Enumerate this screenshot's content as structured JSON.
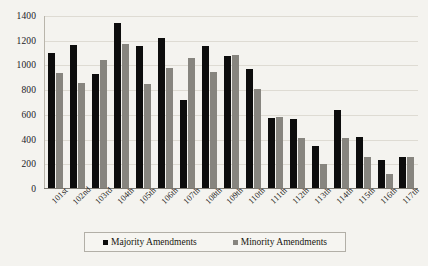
{
  "chart_data": {
    "type": "bar",
    "title": "",
    "xlabel": "",
    "ylabel": "",
    "ylim": [
      0,
      1400
    ],
    "yticks": [
      0,
      200,
      400,
      600,
      800,
      1000,
      1200,
      1400
    ],
    "ytick_labels": [
      "0",
      "200",
      "400",
      "600",
      "800",
      "1000",
      "1200",
      "1400"
    ],
    "grid": true,
    "legend_position": "bottom",
    "categories": [
      "101st",
      "102nd",
      "103rd",
      "104th",
      "105th",
      "106th",
      "107th",
      "108th",
      "109th",
      "110th",
      "111th",
      "112th",
      "113th",
      "114th",
      "115th",
      "116th",
      "117th"
    ],
    "series": [
      {
        "name": "Majority Amendments",
        "color": "#0d0d0d",
        "values": [
          1095,
          1155,
          925,
          1335,
          1150,
          1215,
          715,
          1150,
          1065,
          960,
          565,
          560,
          340,
          635,
          410,
          225,
          250
        ]
      },
      {
        "name": "Minority Amendments",
        "color": "#87857f",
        "values": [
          930,
          850,
          1035,
          1165,
          845,
          970,
          1055,
          940,
          1080,
          800,
          575,
          405,
          195,
          405,
          250,
          115,
          250
        ]
      }
    ]
  },
  "legend": {
    "entries": [
      {
        "label": "Majority Amendments",
        "swatch": "legend-swatch-majority"
      },
      {
        "label": "Minority Amendments",
        "swatch": "legend-swatch-minority"
      }
    ]
  },
  "colors": {
    "majority": "#0d0d0d",
    "minority": "#87857f",
    "background": "#f4f3ef",
    "gridline": "#dedbd3",
    "axis": "#7d7a72"
  }
}
